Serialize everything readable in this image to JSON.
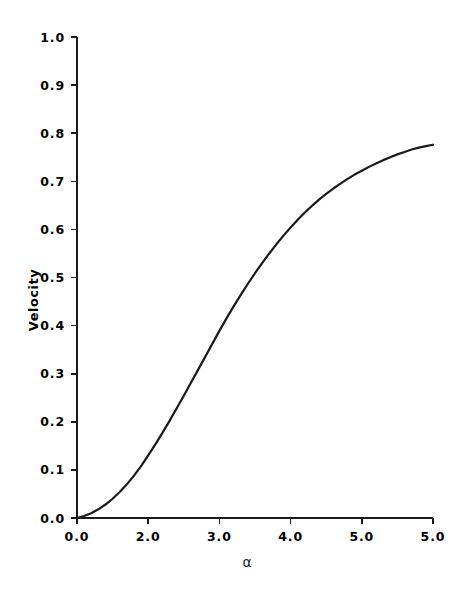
{
  "chart_data": {
    "type": "line",
    "title": "",
    "subtitle": "",
    "xlabel": "α",
    "ylabel": "Velocity",
    "xlim": [
      0.0,
      5.0
    ],
    "ylim": [
      0.0,
      1.0
    ],
    "grid": false,
    "legend": null,
    "line_color": "#1a1a1a",
    "axis_color": "#1a1a1a",
    "background_color": "#ffffff",
    "x_tick_labels": [
      "0.0",
      "2.0",
      "3.0",
      "4.0",
      "5.0"
    ],
    "x_tick_values": [
      0.0,
      1.0,
      2.0,
      3.0,
      4.0
    ],
    "x_minor_ticks": [],
    "y_tick_labels": [
      "1.0",
      "0.9",
      "0.8",
      "0.7",
      "0.6",
      "0.5",
      "0.4",
      "0.3",
      "0.2",
      "0.1",
      "0.0"
    ],
    "y_tick_values": [
      1.0,
      0.9,
      0.8,
      0.7,
      0.6,
      0.5,
      0.4,
      0.3,
      0.2,
      0.1,
      0.0
    ],
    "series": [
      {
        "name": "Velocity",
        "x": [
          0.0,
          0.1,
          0.2,
          0.3,
          0.4,
          0.5,
          0.6,
          0.7,
          0.8,
          0.9,
          1.0,
          1.1,
          1.2,
          1.3,
          1.4,
          1.5,
          1.6,
          1.7,
          1.8,
          1.9,
          2.0,
          2.1,
          2.2,
          2.3,
          2.4,
          2.5,
          2.6,
          2.7,
          2.8,
          2.9,
          3.0,
          3.1,
          3.2,
          3.3,
          3.4,
          3.5,
          3.6,
          3.7,
          3.8,
          3.9,
          4.0,
          4.1,
          4.2,
          4.3,
          4.4,
          4.5,
          4.6,
          4.7,
          4.8,
          4.9,
          5.0
        ],
        "y": [
          0.0,
          0.004,
          0.01,
          0.018,
          0.028,
          0.04,
          0.054,
          0.07,
          0.088,
          0.108,
          0.13,
          0.153,
          0.177,
          0.202,
          0.228,
          0.254,
          0.281,
          0.308,
          0.335,
          0.362,
          0.389,
          0.415,
          0.44,
          0.464,
          0.487,
          0.509,
          0.53,
          0.55,
          0.569,
          0.587,
          0.604,
          0.62,
          0.635,
          0.649,
          0.662,
          0.674,
          0.685,
          0.695,
          0.705,
          0.714,
          0.722,
          0.73,
          0.737,
          0.744,
          0.75,
          0.756,
          0.761,
          0.766,
          0.77,
          0.773,
          0.776
        ]
      }
    ]
  },
  "axes": {
    "y_title": "Velocity",
    "x_title": "α"
  }
}
